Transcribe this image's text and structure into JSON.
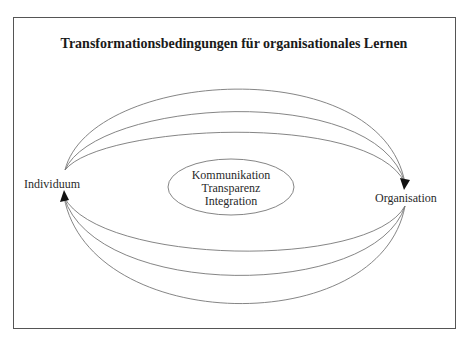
{
  "diagram": {
    "title": "Transformationsbedingungen für organisationales Lernen",
    "nodes": {
      "left": "Individuum",
      "right": "Organisation"
    },
    "center": {
      "items": [
        "Kommunikation",
        "Transparenz",
        "Integration"
      ]
    },
    "arcs": {
      "top_count": 3,
      "top_direction": "Individuum → Organisation",
      "bottom_count": 3,
      "bottom_direction": "Organisation → Individuum"
    },
    "colors": {
      "line": "#666666",
      "frame": "#555555",
      "arrow": "#111111"
    }
  }
}
